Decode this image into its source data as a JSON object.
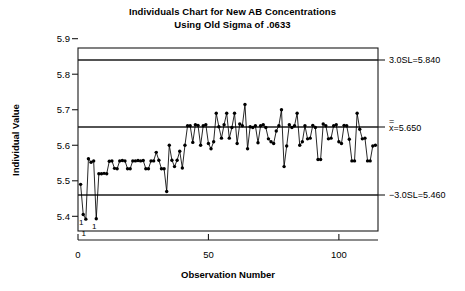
{
  "title": {
    "line1": "Individuals Chart for New AB Concentrations",
    "line2": "Using Old Sigma of .0633"
  },
  "axes": {
    "y_label": "Individual Value",
    "x_label": "Observation Number",
    "y_ticks": [
      "5.4",
      "5.5",
      "5.6",
      "5.7",
      "5.8",
      "5.9"
    ],
    "x_ticks": [
      "0",
      "50",
      "100"
    ]
  },
  "limits": {
    "ucl_label": "3.0SL=5.840",
    "center_label": "x=5.650",
    "center_overbar": "=",
    "lcl_label": "−3.0SL=5.460"
  },
  "violations": {
    "marker": "1",
    "count": 3
  },
  "chart_data": {
    "type": "line",
    "xlabel": "Observation Number",
    "ylabel": "Individual Value",
    "xlim": [
      0,
      115
    ],
    "ylim": [
      5.35,
      5.9
    ],
    "grid": false,
    "legend": "none",
    "sigma": 0.0633,
    "center_line": 5.65,
    "upper_control_limit": 5.84,
    "lower_control_limit": 5.46,
    "annotations": [
      {
        "text": "3.0SL=5.840",
        "y": 5.84,
        "position": "right"
      },
      {
        "text": "x=5.650",
        "y": 5.65,
        "position": "right"
      },
      {
        "text": "-3.0SL=5.460",
        "y": 5.46,
        "position": "right"
      }
    ],
    "violation_points": [
      {
        "x": 2,
        "y": 5.405,
        "label": "1"
      },
      {
        "x": 3,
        "y": 5.392,
        "label": "1"
      },
      {
        "x": 7,
        "y": 5.393,
        "label": "1"
      }
    ],
    "series": [
      {
        "name": "Individual Value",
        "x": [
          1,
          2,
          3,
          4,
          5,
          6,
          7,
          8,
          9,
          10,
          11,
          12,
          13,
          14,
          15,
          16,
          17,
          18,
          19,
          20,
          21,
          22,
          23,
          24,
          25,
          26,
          27,
          28,
          29,
          30,
          31,
          32,
          33,
          34,
          35,
          36,
          37,
          38,
          39,
          40,
          41,
          42,
          43,
          44,
          45,
          46,
          47,
          48,
          49,
          50,
          51,
          52,
          53,
          54,
          55,
          56,
          57,
          58,
          59,
          60,
          61,
          62,
          63,
          64,
          65,
          66,
          67,
          68,
          69,
          70,
          71,
          72,
          73,
          74,
          75,
          76,
          77,
          78,
          79,
          80,
          81,
          82,
          83,
          84,
          85,
          86,
          87,
          88,
          89,
          90,
          91,
          92,
          93,
          94,
          95,
          96,
          97,
          98,
          99,
          100,
          101,
          102,
          103,
          104,
          105,
          106,
          107,
          108,
          109,
          110,
          111,
          112,
          113,
          114
        ],
        "values": [
          5.49,
          5.405,
          5.392,
          5.562,
          5.552,
          5.556,
          5.393,
          5.52,
          5.52,
          5.521,
          5.52,
          5.555,
          5.556,
          5.535,
          5.534,
          5.556,
          5.557,
          5.556,
          5.534,
          5.534,
          5.556,
          5.556,
          5.557,
          5.556,
          5.557,
          5.534,
          5.534,
          5.556,
          5.556,
          5.58,
          5.558,
          5.534,
          5.534,
          5.47,
          5.6,
          5.558,
          5.54,
          5.558,
          5.583,
          5.536,
          5.6,
          5.655,
          5.655,
          5.608,
          5.658,
          5.656,
          5.6,
          5.655,
          5.658,
          5.605,
          5.59,
          5.61,
          5.69,
          5.652,
          5.62,
          5.658,
          5.69,
          5.62,
          5.65,
          5.69,
          5.605,
          5.66,
          5.655,
          5.715,
          5.59,
          5.652,
          5.65,
          5.655,
          5.607,
          5.655,
          5.658,
          5.65,
          5.618,
          5.61,
          5.605,
          5.64,
          5.655,
          5.7,
          5.54,
          5.598,
          5.658,
          5.65,
          5.655,
          5.69,
          5.6,
          5.61,
          5.655,
          5.618,
          5.62,
          5.656,
          5.65,
          5.56,
          5.56,
          5.66,
          5.655,
          5.618,
          5.62,
          5.655,
          5.658,
          5.61,
          5.605,
          5.656,
          5.655,
          5.617,
          5.556,
          5.556,
          5.69,
          5.645,
          5.618,
          5.62,
          5.556,
          5.556,
          5.598,
          5.6
        ]
      }
    ]
  }
}
